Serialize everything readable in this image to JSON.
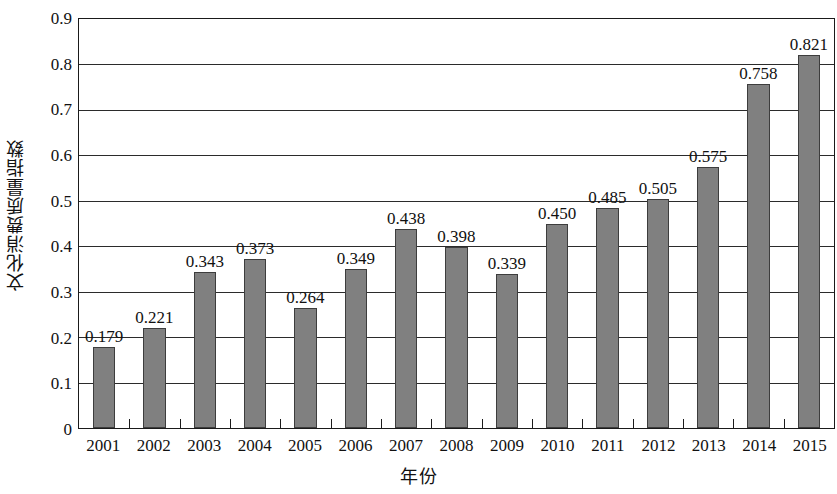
{
  "chart_data": {
    "type": "bar",
    "title": "",
    "xlabel": "年份",
    "ylabel": "文化消费质量指数",
    "categories": [
      "2001",
      "2002",
      "2003",
      "2004",
      "2005",
      "2006",
      "2007",
      "2008",
      "2009",
      "2010",
      "2011",
      "2012",
      "2013",
      "2014",
      "2015"
    ],
    "values": [
      0.179,
      0.221,
      0.343,
      0.373,
      0.264,
      0.349,
      0.438,
      0.398,
      0.339,
      0.45,
      0.485,
      0.505,
      0.575,
      0.758,
      0.821
    ],
    "data_labels": [
      "0.179",
      "0.221",
      "0.343",
      "0.373",
      "0.264",
      "0.349",
      "0.438",
      "0.398",
      "0.339",
      "0.450",
      "0.485",
      "0.505",
      "0.575",
      "0.758",
      "0.821"
    ],
    "ylim": [
      0,
      0.9
    ],
    "y_tick_values": [
      0,
      0.1,
      0.2,
      0.3,
      0.4,
      0.5,
      0.6,
      0.7,
      0.8,
      0.9
    ],
    "y_tick_labels": [
      "0",
      "0.1",
      "0.2",
      "0.3",
      "0.4",
      "0.5",
      "0.6",
      "0.7",
      "0.8",
      "0.9"
    ],
    "grid": "horizontal",
    "legend": "none",
    "bar_color": "#808080",
    "bar_border_color": "#3d3d3d",
    "axis_color": "#1a1a1a",
    "gridline_color": "#2b2b2b",
    "background_color": "#ffffff"
  }
}
